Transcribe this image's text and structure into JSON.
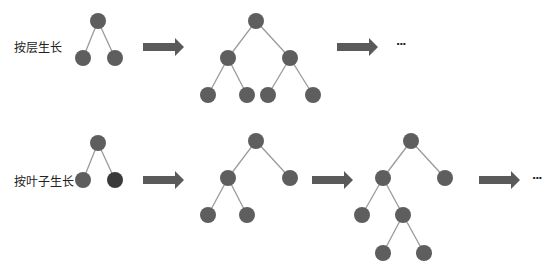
{
  "rows": [
    {
      "label": "按层生长",
      "ellipsis": "···"
    },
    {
      "label": "按叶子生长",
      "ellipsis": "···"
    }
  ],
  "colors": {
    "node": "#5e5e5e",
    "node_highlight": "#3a3a3a",
    "edge": "#9a9a9a",
    "arrow": "#5a5a5a"
  }
}
